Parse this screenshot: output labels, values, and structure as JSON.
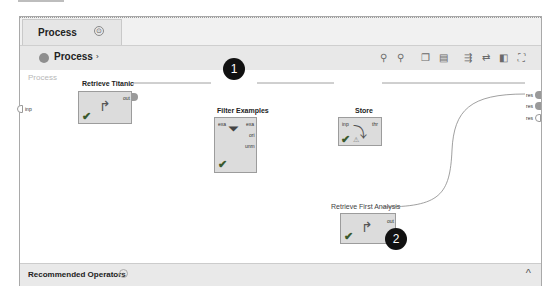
{
  "tab": {
    "label": "Process",
    "pin_icon": "pin-icon"
  },
  "breadcrumb": {
    "label": "Process",
    "arrow": "›"
  },
  "toolbar": {
    "icons": [
      {
        "name": "zoom-in-icon",
        "glyph": "⚲"
      },
      {
        "name": "zoom-out-icon",
        "glyph": "⚲"
      },
      {
        "name": "copy-icon",
        "glyph": "❐"
      },
      {
        "name": "paste-icon",
        "glyph": "▤"
      },
      {
        "name": "auto-wire-icon",
        "glyph": "⇶"
      },
      {
        "name": "rewire-icon",
        "glyph": "⇄"
      },
      {
        "name": "arrange-icon",
        "glyph": "◧"
      },
      {
        "name": "fit-view-icon",
        "glyph": "⛶"
      }
    ]
  },
  "canvas": {
    "label": "Process",
    "input_port": "inp",
    "result_ports": [
      "res",
      "res",
      "res"
    ],
    "operators": [
      {
        "title": "Retrieve Titanic",
        "out_ports": [
          "out"
        ],
        "in_ports": []
      },
      {
        "title": "Filter Examples",
        "in_ports": [
          "exa"
        ],
        "out_ports": [
          "exa",
          "ori",
          "unm"
        ]
      },
      {
        "title": "Store",
        "in_ports": [
          "inp"
        ],
        "out_ports": [
          "thr"
        ]
      },
      {
        "title": "Retrieve First Analysis",
        "in_ports": [],
        "out_ports": [
          "out"
        ]
      }
    ],
    "badges": [
      "1",
      "2"
    ]
  },
  "footer": {
    "label": "Recommended Operators",
    "info": "i",
    "caret": "^"
  }
}
